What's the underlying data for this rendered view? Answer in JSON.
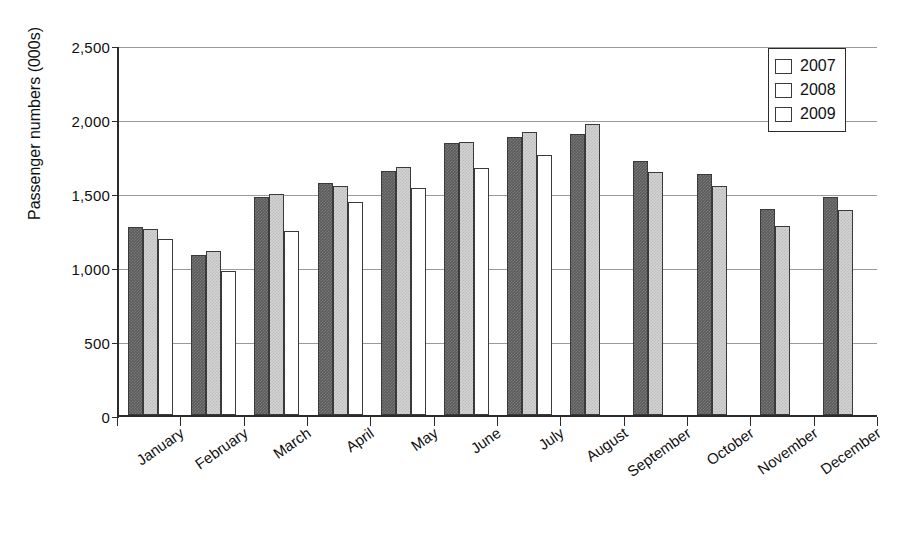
{
  "chart_data": {
    "type": "bar",
    "title": "",
    "xlabel": "",
    "ylabel": "Passenger numbers (000s)",
    "ylim": [
      0,
      2500
    ],
    "yticks": [
      0,
      500,
      1000,
      1500,
      2000,
      2500
    ],
    "ytick_labels": [
      "0",
      "500",
      "1,000",
      "1,500",
      "2,000",
      "2,500"
    ],
    "grid": true,
    "legend_position": "top-right",
    "categories": [
      "January",
      "February",
      "March",
      "April",
      "May",
      "June",
      "July",
      "August",
      "September",
      "October",
      "November",
      "December"
    ],
    "series": [
      {
        "name": "2007",
        "color": "#5b5b5b",
        "values": [
          1270,
          1080,
          1470,
          1565,
          1650,
          1840,
          1880,
          1900,
          1715,
          1630,
          1390,
          1470
        ]
      },
      {
        "name": "2008",
        "color": "#d2d2d2",
        "values": [
          1255,
          1110,
          1490,
          1550,
          1675,
          1845,
          1915,
          1965,
          1645,
          1545,
          1275,
          1385
        ]
      },
      {
        "name": "2009",
        "color": "#ffffff",
        "values": [
          1190,
          975,
          1240,
          1440,
          1535,
          1670,
          1760,
          null,
          null,
          null,
          null,
          null
        ]
      }
    ]
  },
  "legend": {
    "entries": [
      {
        "label": "2007"
      },
      {
        "label": "2008"
      },
      {
        "label": "2009"
      }
    ]
  }
}
